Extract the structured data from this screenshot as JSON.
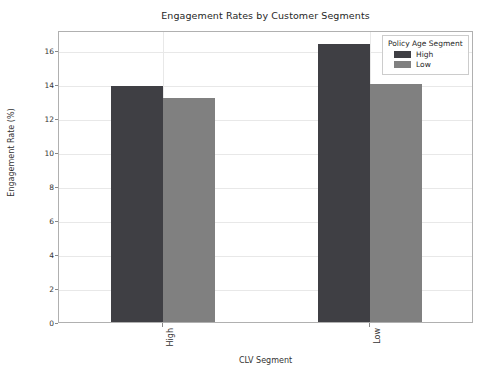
{
  "chart_data": {
    "type": "bar",
    "title": "Engagement Rates by Customer Segments",
    "xlabel": "CLV Segment",
    "ylabel": "Engagement Rate (%)",
    "categories": [
      "High",
      "Low"
    ],
    "series": [
      {
        "name": "High",
        "values": [
          13.9,
          16.4
        ],
        "color": "#3f3f44"
      },
      {
        "name": "Low",
        "values": [
          13.2,
          14.0
        ],
        "color": "#808080"
      }
    ],
    "ylim": [
      0,
      17.2
    ],
    "yticks": [
      0,
      2,
      4,
      6,
      8,
      10,
      12,
      14,
      16
    ],
    "ytick_labels": [
      "0",
      "2",
      "4",
      "6",
      "8",
      "10",
      "12",
      "14",
      "16"
    ],
    "xtick_labels": [
      "High",
      "Low"
    ],
    "grid": true,
    "grid_axis": "both",
    "legend": {
      "title": "Policy Age Segment",
      "position": "upper right",
      "entries": [
        {
          "label": "High",
          "color": "#3f3f44"
        },
        {
          "label": "Low",
          "color": "#808080"
        }
      ]
    }
  }
}
